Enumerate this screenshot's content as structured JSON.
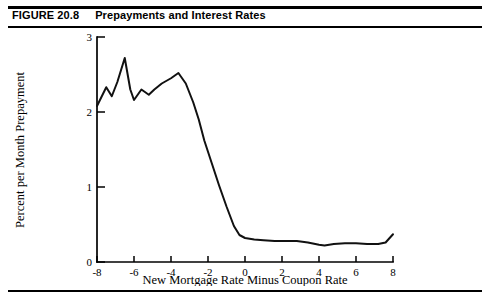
{
  "caption": {
    "figure_number": "FIGURE 20.8",
    "title": "Prepayments and Interest Rates"
  },
  "footer": {
    "bleed_text": ""
  },
  "chart_data": {
    "type": "line",
    "title": "Prepayments and Interest Rates",
    "xlabel": "New Mortgage Rate Minus Coupon Rate",
    "ylabel": "Percent per Month Prepayment",
    "xlim": [
      -8,
      8
    ],
    "ylim": [
      0,
      3
    ],
    "xticks": [
      -8,
      -6,
      -4,
      -2,
      0,
      2,
      4,
      6,
      8
    ],
    "xtick_labels": [
      "-8",
      "-6",
      "-4",
      "-2",
      "0",
      "2",
      "4",
      "6",
      "8"
    ],
    "yticks": [
      0,
      1,
      2,
      3
    ],
    "ytick_labels": [
      "0",
      "1",
      "2",
      "3"
    ],
    "grid": false,
    "legend": false,
    "line_color": "#111111",
    "series": [
      {
        "name": "Prepayment rate",
        "x": [
          -8.0,
          -7.5,
          -7.2,
          -6.9,
          -6.5,
          -6.2,
          -6.0,
          -5.6,
          -5.2,
          -4.9,
          -4.5,
          -4.0,
          -3.6,
          -3.2,
          -2.8,
          -2.5,
          -2.2,
          -1.8,
          -1.4,
          -1.0,
          -0.6,
          -0.3,
          0.0,
          0.5,
          1.0,
          1.6,
          2.2,
          2.8,
          3.4,
          4.0,
          4.3,
          4.8,
          5.4,
          6.0,
          6.6,
          7.2,
          7.6,
          8.0
        ],
        "y": [
          2.08,
          2.33,
          2.21,
          2.4,
          2.72,
          2.3,
          2.16,
          2.3,
          2.23,
          2.3,
          2.38,
          2.45,
          2.52,
          2.38,
          2.13,
          1.9,
          1.62,
          1.32,
          1.02,
          0.74,
          0.48,
          0.36,
          0.32,
          0.3,
          0.29,
          0.28,
          0.28,
          0.28,
          0.26,
          0.23,
          0.22,
          0.24,
          0.25,
          0.25,
          0.24,
          0.24,
          0.26,
          0.37
        ]
      }
    ]
  }
}
